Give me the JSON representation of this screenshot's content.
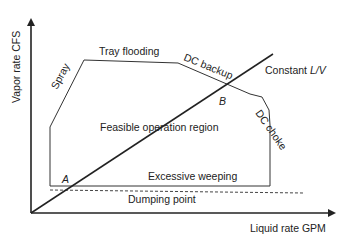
{
  "diagram": {
    "axes": {
      "y_label": "Vapor rate CFS",
      "x_label": "Liquid rate GPM"
    },
    "region_label": "Feasible operation region",
    "boundaries": {
      "spray": "Spray",
      "tray_flooding": "Tray flooding",
      "dc_backup": "DC backup",
      "dc_choke": "DC choke",
      "excessive_weeping": "Excessive weeping",
      "dumping_point": "Dumping point"
    },
    "operating_line": {
      "label_prefix": "Constant ",
      "label_italic": "L/V"
    },
    "points": {
      "a": "A",
      "b": "B"
    },
    "colors": {
      "line": "#222222",
      "axis": "#222222",
      "background": "#ffffff"
    }
  }
}
